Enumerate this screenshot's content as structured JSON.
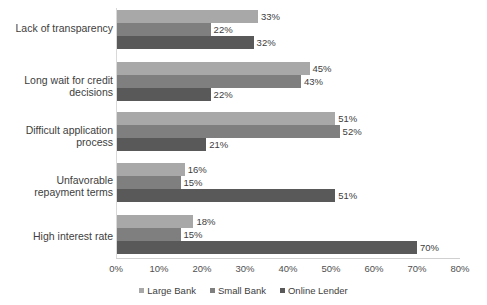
{
  "chart_data": {
    "type": "bar",
    "orientation": "horizontal",
    "title": "",
    "subtitle": "",
    "xlabel": "",
    "ylabel": "",
    "xlim": [
      0,
      80
    ],
    "xtick_labels": [
      "0%",
      "10%",
      "20%",
      "30%",
      "40%",
      "50%",
      "60%",
      "70%",
      "80%"
    ],
    "xtick_values": [
      0,
      10,
      20,
      30,
      40,
      50,
      60,
      70,
      80
    ],
    "grid": false,
    "legend_position": "bottom-center",
    "value_label_suffix": "%",
    "categories": [
      "Lack of transparency",
      "Long wait for credit decisions",
      "Difficult application process",
      "Unfavorable repayment terms",
      "High interest rate"
    ],
    "category_lines": [
      [
        "Lack of transparency"
      ],
      [
        "Long wait for credit",
        "decisions"
      ],
      [
        "Difficult application",
        "process"
      ],
      [
        "Unfavorable",
        "repayment terms"
      ],
      [
        "High interest rate"
      ]
    ],
    "series": [
      {
        "name": "Large Bank",
        "color": "#a8a8a8",
        "values": [
          33,
          45,
          51,
          16,
          18
        ]
      },
      {
        "name": "Small Bank",
        "color": "#7f7f7f",
        "values": [
          22,
          43,
          52,
          15,
          15
        ]
      },
      {
        "name": "Online Lender",
        "color": "#595959",
        "values": [
          32,
          22,
          21,
          51,
          70
        ]
      }
    ],
    "value_labels": [
      [
        "33%",
        "22%",
        "32%"
      ],
      [
        "45%",
        "43%",
        "22%"
      ],
      [
        "51%",
        "52%",
        "21%"
      ],
      [
        "16%",
        "15%",
        "51%"
      ],
      [
        "18%",
        "15%",
        "70%"
      ]
    ]
  }
}
